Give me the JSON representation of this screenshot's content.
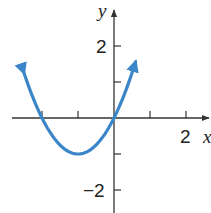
{
  "chart_data": {
    "type": "line",
    "title": "",
    "function": "y = x^2 + 2x",
    "xlabel": "x",
    "ylabel": "y",
    "xlim": [
      -3.0,
      2.7
    ],
    "ylim": [
      -2.6,
      3.3
    ],
    "x_ticks": [
      -2,
      -1,
      1,
      2
    ],
    "y_ticks": [
      2,
      1,
      -1,
      -2
    ],
    "x_tick_labels": [
      {
        "value": 2,
        "label": "2"
      }
    ],
    "y_tick_labels": [
      {
        "value": 2,
        "label": "2"
      },
      {
        "value": -2,
        "label": "−2"
      }
    ],
    "grid": false,
    "legend": null,
    "series": [
      {
        "name": "parabola",
        "color": "#3a86c8",
        "x": [
          -2.5,
          -2.25,
          -2,
          -1.75,
          -1.5,
          -1.25,
          -1,
          -0.75,
          -0.5,
          -0.25,
          0,
          0.25,
          0.5,
          0.6
        ],
        "y": [
          1.25,
          0.5625,
          0,
          -0.4375,
          -0.75,
          -0.9375,
          -1,
          -0.9375,
          -0.75,
          -0.4375,
          0,
          0.5625,
          1.25,
          1.56
        ],
        "arrows_at_ends": true
      }
    ],
    "key_points": {
      "vertex": [
        -1,
        -1
      ],
      "x_intercepts": [
        -2,
        0
      ],
      "y_intercept": 0
    }
  },
  "labels": {
    "x_axis": "x",
    "y_axis": "y",
    "tick_x_2": "2",
    "tick_y_2": "2",
    "tick_y_neg2": "−2"
  }
}
